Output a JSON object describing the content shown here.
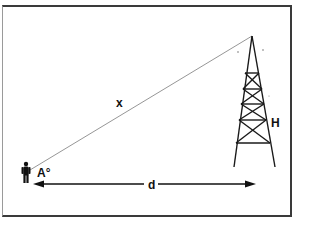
{
  "diagram": {
    "type": "trigonometry-height-of-tower",
    "labels": {
      "hypotenuse": "x",
      "height": "H",
      "angle": "A°",
      "distance": "d"
    },
    "elements": {
      "observer": "person-silhouette",
      "tower": "lattice-transmission-tower",
      "line_of_sight": "line from observer to tower top",
      "distance_arrow": "double-headed arrow between observer and tower base"
    },
    "colors": {
      "line": "#111111",
      "sightline": "#8a8a8a",
      "frame": "#3a3a3a",
      "background": "#ffffff"
    }
  }
}
